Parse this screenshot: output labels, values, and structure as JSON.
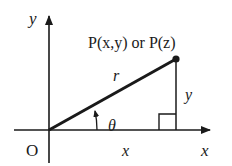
{
  "diagram": {
    "axes": {
      "x_label": "x",
      "y_label": "y",
      "origin_label": "O"
    },
    "point": {
      "label": "P(x,y) or P(z)"
    },
    "segments": {
      "radius_label": "r",
      "vertical_label": "y",
      "horizontal_label": "x"
    },
    "angle": {
      "label": "θ"
    },
    "colors": {
      "stroke": "#1a1a1a",
      "background": "#ffffff"
    }
  }
}
